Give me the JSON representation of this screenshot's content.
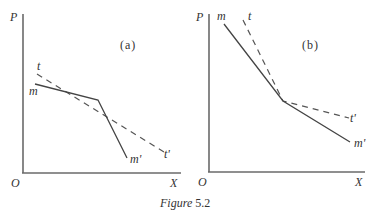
{
  "figure": {
    "caption_prefix": "Figure",
    "caption_number": "5.2"
  },
  "panels": [
    {
      "id": "a",
      "label": "(a)",
      "y_axis_label": "P",
      "x_axis_label": "X",
      "origin_label": "O",
      "curves": [
        {
          "name": "m",
          "start_label": "m",
          "end_label": "m'",
          "style": "solid",
          "description": "gentle slope to intersection, then steep drop"
        },
        {
          "name": "t",
          "start_label": "t",
          "end_label": "t'",
          "style": "dashed",
          "description": "single straight line of moderate slope"
        }
      ]
    },
    {
      "id": "b",
      "label": "(b)",
      "y_axis_label": "P",
      "x_axis_label": "X",
      "origin_label": "O",
      "curves": [
        {
          "name": "m",
          "start_label": "m",
          "end_label": "m'",
          "style": "solid",
          "description": "steep slope to intersection, then gentler slope"
        },
        {
          "name": "t",
          "start_label": "t",
          "end_label": "t'",
          "style": "dashed",
          "description": "steeper above intersection, flatter below"
        }
      ]
    }
  ],
  "labels": {
    "a_P": "P",
    "a_O": "O",
    "a_X": "X",
    "a_panel": "(a)",
    "a_t": "t",
    "a_t_end": "t'",
    "a_m": "m",
    "a_m_end": "m'",
    "b_P": "P",
    "b_O": "O",
    "b_X": "X",
    "b_panel": "(b)",
    "b_t": "t",
    "b_t_end": "t'",
    "b_m": "m",
    "b_m_end": "m'"
  }
}
